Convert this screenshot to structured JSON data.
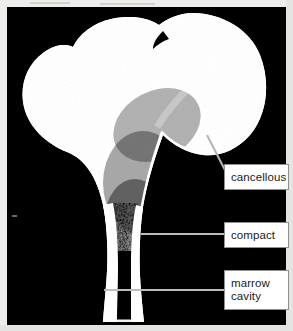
{
  "figure": {
    "background_color": "#000000",
    "bone_color": "#ffffff",
    "margin_color": "#ededeb"
  },
  "callouts": [
    {
      "id": "cancellous",
      "lines": [
        "cancellous"
      ],
      "box": {
        "x": 224,
        "y": 164,
        "w": 65,
        "h": 26
      },
      "leader": {
        "type": "diagonal",
        "x1": 207,
        "y1": 134,
        "x2": 225,
        "y2": 169
      },
      "box_border_color": "#8f8f8f",
      "box_fill_color": "#ffffff",
      "text_color": "#1a1a1a"
    },
    {
      "id": "compact",
      "lines": [
        "compact"
      ],
      "box": {
        "x": 224,
        "y": 222,
        "w": 65,
        "h": 26
      },
      "leader": {
        "type": "horizontal",
        "x1": 141,
        "y1": 234,
        "x2": 224,
        "y2": 234
      },
      "box_border_color": "#8f8f8f",
      "box_fill_color": "#ffffff",
      "text_color": "#1a1a1a"
    },
    {
      "id": "marrow-cavity",
      "lines": [
        "marrow",
        "cavity"
      ],
      "box": {
        "x": 224,
        "y": 270,
        "w": 65,
        "h": 40
      },
      "leader": {
        "type": "horizontal",
        "x1": 104,
        "y1": 290,
        "x2": 224,
        "y2": 290
      },
      "box_border_color": "#8f8f8f",
      "box_fill_color": "#ffffff",
      "text_color": "#1a1a1a"
    }
  ],
  "leader_color": "#bdbdbd"
}
